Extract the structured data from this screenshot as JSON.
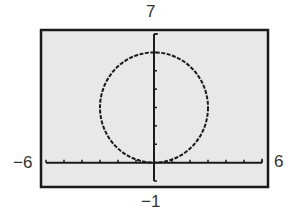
{
  "chart_data": {
    "type": "line",
    "title": "",
    "equation": "x^2 + (y-3)^2 = 9",
    "series": [
      {
        "name": "circle",
        "center": [
          0,
          3
        ],
        "radius": 3,
        "x": [
          0,
          3,
          0,
          -3,
          0
        ],
        "y": [
          0,
          3,
          6,
          3,
          0
        ]
      }
    ],
    "xlabel": "",
    "ylabel": "",
    "xlim": [
      -6,
      6
    ],
    "ylim": [
      -1,
      7
    ],
    "xscale": 1,
    "yscale": 1,
    "grid": false,
    "window_labels": {
      "xmin": "−6",
      "xmax": "6",
      "ymin": "−1",
      "ymax": "7"
    }
  },
  "colors": {
    "frame": "#1a1a1a",
    "screen_bg": "#e8e8e8",
    "curve": "#1a1a1a",
    "axes": "#1a1a1a"
  }
}
